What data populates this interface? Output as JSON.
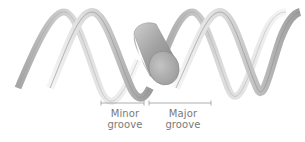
{
  "diagram": {
    "labels": {
      "minor_groove": {
        "line1": "Minor",
        "line2": "groove"
      },
      "major_groove": {
        "line1": "Major",
        "line2": "groove"
      }
    },
    "colors": {
      "strand_light": "#f2f2f2",
      "strand_mid": "#c8c8c8",
      "strand_dark": "#8f8f8f",
      "strand_edge": "#9a9a9a",
      "cylinder_body": "#a8a8a8",
      "cylinder_end": "#b5b5b5",
      "bracket": "#9a9a9a",
      "text": "#7a7a7a"
    }
  }
}
